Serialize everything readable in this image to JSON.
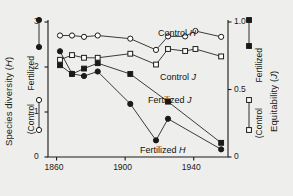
{
  "figure": {
    "background": "#eeeeec",
    "ink": "#1a1a1a"
  },
  "left_axis": {
    "title_main": "Species diversity (",
    "title_italic": "H",
    "title_close": ")",
    "title_full": "Species diversity (H)",
    "ticks": [
      "0",
      "1",
      "2",
      "3"
    ],
    "range": [
      0,
      3
    ]
  },
  "right_axis": {
    "title_main": "Equitability (",
    "title_italic": "J",
    "title_close": ")",
    "title_full": "Equitability (J)",
    "ticks": [
      "0",
      "0.5",
      "1.0"
    ],
    "range": [
      0,
      1.0
    ]
  },
  "x_axis": {
    "ticks": [
      "1860",
      "1900",
      "1940"
    ],
    "range": [
      1855,
      1960
    ]
  },
  "legend_left": {
    "fertilized_label": "Fertilized",
    "control_label": "(Control",
    "fertilized_marker": "filled-circle",
    "control_marker": "open-circle"
  },
  "legend_right": {
    "fertilized_label": "Fertilized",
    "control_label": "(Control",
    "fertilized_marker": "filled-square",
    "control_marker": "open-square"
  },
  "series_labels": {
    "control_h": "Control H",
    "control_j": "Control J",
    "fertilized_j": "Fertilized J",
    "fertilized_h": "Fertilized H"
  },
  "chart_data": {
    "type": "line",
    "title": "",
    "xlabel": "",
    "ylabel": "Species diversity (H)",
    "y2label": "Equitability (J)",
    "xlim": [
      1855,
      1960
    ],
    "ylim": [
      0,
      3
    ],
    "y2lim": [
      0,
      1.0
    ],
    "grid": false,
    "legend_position": "inline-annotations",
    "xticks": [
      1860,
      1900,
      1940
    ],
    "yticks": [
      0,
      1,
      2,
      3
    ],
    "y2ticks": [
      0,
      0.5,
      1.0
    ],
    "series": [
      {
        "name": "Control H",
        "axis": "left",
        "marker": "open-circle",
        "x": [
          1862,
          1869,
          1876,
          1884,
          1903,
          1918,
          1925,
          1935,
          1941,
          1956
        ],
        "y": [
          2.7,
          2.7,
          2.67,
          2.7,
          2.63,
          2.38,
          2.68,
          2.68,
          2.8,
          2.67
        ]
      },
      {
        "name": "Control J",
        "axis": "right",
        "marker": "open-square",
        "x": [
          1862,
          1869,
          1876,
          1884,
          1903,
          1918,
          1925,
          1935,
          1941,
          1956
        ],
        "y": [
          0.72,
          0.755,
          0.735,
          0.735,
          0.765,
          0.685,
          0.8,
          0.785,
          0.8,
          0.745
        ]
      },
      {
        "name": "Fertilized H",
        "axis": "left",
        "marker": "filled-circle",
        "x": [
          1862,
          1869,
          1876,
          1884,
          1903,
          1918,
          1925,
          1956
        ],
        "y": [
          2.35,
          1.85,
          1.8,
          1.9,
          1.18,
          0.37,
          0.85,
          0.17
        ]
      },
      {
        "name": "Fertilized J",
        "axis": "right",
        "marker": "filled-square",
        "x": [
          1862,
          1869,
          1876,
          1884,
          1903,
          1925,
          1956
        ],
        "y": [
          0.68,
          0.615,
          0.655,
          0.695,
          0.615,
          0.41,
          0.105
        ]
      }
    ]
  }
}
